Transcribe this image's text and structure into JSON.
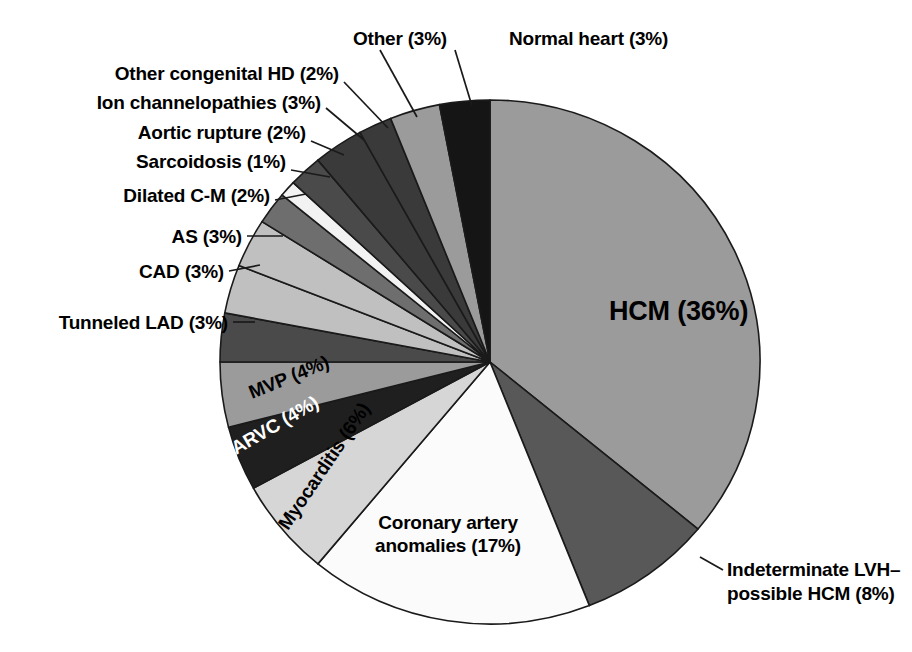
{
  "figure": {
    "type": "pie-chart",
    "background_color": "#ffffff",
    "outline_color": "#1a1a1a",
    "width": 912,
    "height": 652
  },
  "chart_data": {
    "type": "pie",
    "title": "",
    "xlabel": "",
    "ylabel": "",
    "legend_position": "none",
    "grid": false,
    "units": "percent",
    "start_angle_deg": 0,
    "direction": "clockwise",
    "categories": [
      "HCM",
      "Indeterminate LVH–possible HCM",
      "Coronary artery anomalies",
      "Myocarditis",
      "ARVC",
      "MVP",
      "Tunneled LAD",
      "CAD",
      "AS",
      "Dilated C-M",
      "Sarcoidosis",
      "Aortic rupture",
      "Ion channelopathies",
      "Other congenital HD",
      "Other",
      "Normal heart"
    ],
    "values": [
      36,
      8,
      17,
      6,
      4,
      4,
      3,
      3,
      3,
      2,
      1,
      2,
      3,
      2,
      3,
      3
    ],
    "labels": [
      "HCM (36%)",
      "Indeterminate LVH–",
      "Coronary artery",
      "Myocarditis (6%)",
      "ARVC (4%)",
      "MVP (4%)",
      "Tunneled LAD (3%)",
      "CAD (3%)",
      "AS (3%)",
      "Dilated C-M (2%)",
      "Sarcoidosis (1%)",
      "Aortic rupture (2%)",
      "Ion channelopathies (3%)",
      "Other congenital HD (2%)",
      "Other (3%)",
      "Normal heart (3%)"
    ],
    "colors": [
      "#9b9b9b",
      "#585858",
      "#fbfbfb",
      "#d6d6d6",
      "#1f1f1f",
      "#9b9b9b",
      "#4a4a4a",
      "#c0c0c0",
      "#c0c0c0",
      "#6e6e6e",
      "#f2f2f2",
      "#4a4a4a",
      "#3a3a3a",
      "#3a3a3a",
      "#9b9b9b",
      "#151515"
    ]
  },
  "labels": {
    "hcm": "HCM (36%)",
    "indeterminate_line1": "Indeterminate LVH–",
    "indeterminate_line2": "possible HCM (8%)",
    "coronary_line1": "Coronary artery",
    "coronary_line2": "anomalies (17%)",
    "myocarditis": "Myocarditis (6%)",
    "arvc": "ARVC (4%)",
    "mvp": "MVP (4%)",
    "tunneled_lad": "Tunneled LAD (3%)",
    "cad": "CAD (3%)",
    "as": "AS (3%)",
    "dilated_cm": "Dilated C-M (2%)",
    "sarcoidosis": "Sarcoidosis (1%)",
    "aortic_rupture": "Aortic rupture (2%)",
    "ion_channelopathies": "Ion channelopathies (3%)",
    "other_congenital_hd": "Other congenital HD (2%)",
    "other": "Other (3%)",
    "normal_heart": "Normal heart (3%)"
  }
}
